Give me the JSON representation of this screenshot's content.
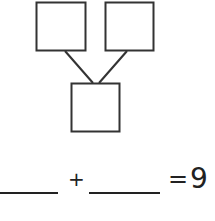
{
  "diagram": {
    "type": "number-bond",
    "parts": [
      "",
      ""
    ],
    "whole": ""
  },
  "equation": {
    "blank1": "",
    "plus": "+",
    "blank2": "",
    "equals": "=",
    "result": "9"
  }
}
